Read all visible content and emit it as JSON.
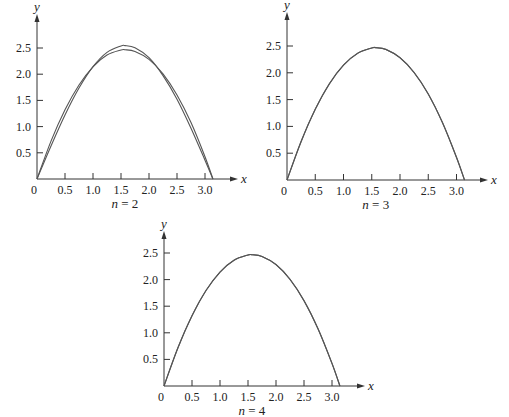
{
  "figure": {
    "panels": [
      {
        "id": "n2",
        "caption": "n = 2",
        "origin_px": [
          37,
          179
        ],
        "px_per_unit": [
          56,
          52.4
        ],
        "x_axis_end_px": 232,
        "y_axis_top_px": 20
      },
      {
        "id": "n3",
        "caption": "n = 3",
        "origin_px": [
          287,
          180
        ],
        "px_per_unit": [
          56.5,
          53.6
        ],
        "x_axis_end_px": 482,
        "y_axis_top_px": 18
      },
      {
        "id": "n4",
        "caption": "n = 4",
        "origin_px": [
          164,
          386
        ],
        "px_per_unit": [
          56,
          53.2
        ],
        "x_axis_end_px": 359,
        "y_axis_top_px": 237
      }
    ],
    "colors": {
      "axis": "#333333",
      "curve": "#555555",
      "text": "#222222"
    }
  },
  "chart_data": [
    {
      "type": "line",
      "title": "n = 2",
      "xlabel": "x",
      "ylabel": "y",
      "xlim": [
        0,
        3.2
      ],
      "ylim": [
        0,
        2.7
      ],
      "grid": false,
      "legend": null,
      "x_ticks": [
        "0",
        "0.5",
        "1.0",
        "1.5",
        "2.0",
        "2.5",
        "3.0"
      ],
      "y_ticks": [
        "0.5",
        "1.0",
        "1.5",
        "2.0",
        "2.5"
      ],
      "x": [
        0,
        0.25,
        0.5,
        0.75,
        1.0,
        1.25,
        1.5,
        1.5708,
        1.75,
        2.0,
        2.25,
        2.5,
        2.75,
        3.0,
        3.1416
      ],
      "series": [
        {
          "name": "f(x)",
          "values": [
            0,
            0.723,
            1.321,
            1.794,
            2.142,
            2.365,
            2.462,
            2.467,
            2.435,
            2.283,
            2.006,
            1.604,
            1.077,
            0.425,
            0
          ]
        },
        {
          "name": "approximation",
          "values": [
            0,
            0.63,
            1.221,
            1.735,
            2.143,
            2.416,
            2.54,
            2.546,
            2.505,
            2.315,
            1.973,
            1.524,
            0.97,
            0.359,
            0
          ]
        }
      ]
    },
    {
      "type": "line",
      "title": "n = 3",
      "xlabel": "x",
      "ylabel": "y",
      "xlim": [
        0,
        3.2
      ],
      "ylim": [
        0,
        2.7
      ],
      "grid": false,
      "legend": null,
      "x_ticks": [
        "0",
        "0.5",
        "1.0",
        "1.5",
        "2.0",
        "2.5",
        "3.0"
      ],
      "y_ticks": [
        "0.5",
        "1.0",
        "1.5",
        "2.0",
        "2.5"
      ],
      "x": [
        0,
        0.25,
        0.5,
        0.75,
        1.0,
        1.25,
        1.5,
        1.5708,
        1.75,
        2.0,
        2.25,
        2.5,
        2.75,
        3.0,
        3.1416
      ],
      "series": [
        {
          "name": "f(x)",
          "values": [
            0,
            0.723,
            1.321,
            1.794,
            2.142,
            2.365,
            2.462,
            2.467,
            2.435,
            2.283,
            2.006,
            1.604,
            1.077,
            0.425,
            0
          ]
        },
        {
          "name": "approximation",
          "values": [
            0,
            0.715,
            1.318,
            1.797,
            2.143,
            2.362,
            2.463,
            2.47,
            2.437,
            2.28,
            2.004,
            1.606,
            1.074,
            0.42,
            0
          ]
        }
      ]
    },
    {
      "type": "line",
      "title": "n = 4",
      "xlabel": "x",
      "ylabel": "y",
      "xlim": [
        0,
        3.2
      ],
      "ylim": [
        0,
        2.7
      ],
      "grid": false,
      "legend": null,
      "x_ticks": [
        "0",
        "0.5",
        "1.0",
        "1.5",
        "2.0",
        "2.5",
        "3.0"
      ],
      "y_ticks": [
        "0.5",
        "1.0",
        "1.5",
        "2.0",
        "2.5"
      ],
      "x": [
        0,
        0.25,
        0.5,
        0.75,
        1.0,
        1.25,
        1.5,
        1.5708,
        1.75,
        2.0,
        2.25,
        2.5,
        2.75,
        3.0,
        3.1416
      ],
      "series": [
        {
          "name": "f(x)",
          "values": [
            0,
            0.723,
            1.321,
            1.794,
            2.142,
            2.365,
            2.462,
            2.467,
            2.435,
            2.283,
            2.006,
            1.604,
            1.077,
            0.425,
            0
          ]
        },
        {
          "name": "approximation",
          "values": [
            0,
            0.72,
            1.32,
            1.795,
            2.142,
            2.364,
            2.462,
            2.468,
            2.436,
            2.282,
            2.005,
            1.605,
            1.076,
            0.423,
            0
          ]
        }
      ]
    }
  ]
}
